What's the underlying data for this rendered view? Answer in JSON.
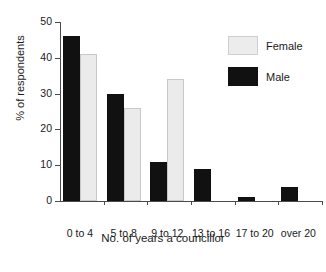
{
  "chart_data": {
    "type": "bar",
    "title": "",
    "subtitle": "",
    "xlabel": "No. of years a councillor",
    "ylabel": "% of respondents",
    "categories": [
      "0 to 4",
      "5 to 8",
      "9 to 12",
      "13 to 16",
      "17 to 20",
      "over 20"
    ],
    "series": [
      {
        "name": "Male",
        "color": "#111111",
        "values": [
          46,
          30,
          11,
          9,
          1,
          4
        ]
      },
      {
        "name": "Female",
        "color": "#ececec",
        "values": [
          41,
          26,
          34,
          0,
          0,
          0
        ]
      }
    ],
    "ylim": [
      0,
      50
    ],
    "yticks": [
      0,
      10,
      20,
      30,
      40,
      50
    ],
    "ytick_labels": [
      "0",
      "10",
      "20",
      "30",
      "40",
      "50"
    ],
    "grid": false,
    "legend_position": "top-right",
    "legend_entries": [
      "Female",
      "Male"
    ]
  },
  "axes": {
    "y_title": "% of respondents",
    "x_title": "No. of years a councillor"
  },
  "legend": {
    "female_label": "Female",
    "male_label": "Male"
  }
}
